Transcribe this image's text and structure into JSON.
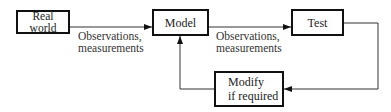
{
  "diagram": {
    "nodes": {
      "real_world": {
        "line1": "Real",
        "line2": "world"
      },
      "model": {
        "label": "Model"
      },
      "test": {
        "label": "Test"
      },
      "modify": {
        "line1": "Modify",
        "line2": "if required"
      }
    },
    "edges": {
      "realworld_to_model": {
        "line1": "Observations,",
        "line2": "measurements"
      },
      "model_to_test": {
        "line1": "Observations,",
        "line2": "measurements"
      },
      "test_to_modify": {
        "label": ""
      },
      "modify_to_model": {
        "label": ""
      }
    },
    "colors": {
      "stroke": "#111111",
      "text": "#222222",
      "background": "#ffffff"
    }
  }
}
